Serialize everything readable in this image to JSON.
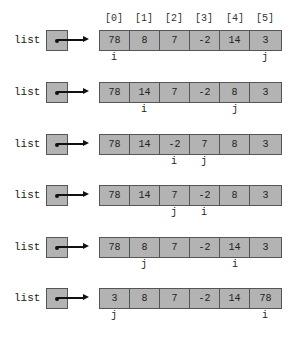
{
  "variable_name": "list",
  "indices": [
    "[0]",
    "[1]",
    "[2]",
    "[3]",
    "[4]",
    "[5]"
  ],
  "steps": [
    {
      "values": [
        "78",
        "8",
        "7",
        "-2",
        "14",
        "3"
      ],
      "i": 0,
      "j": 5
    },
    {
      "values": [
        "78",
        "14",
        "7",
        "-2",
        "8",
        "3"
      ],
      "i": 1,
      "j": 4
    },
    {
      "values": [
        "78",
        "14",
        "-2",
        "7",
        "8",
        "3"
      ],
      "i": 2,
      "j": 3
    },
    {
      "values": [
        "78",
        "14",
        "7",
        "-2",
        "8",
        "3"
      ],
      "i": 3,
      "j": 2
    },
    {
      "values": [
        "78",
        "8",
        "7",
        "-2",
        "14",
        "3"
      ],
      "i": 4,
      "j": 1
    },
    {
      "values": [
        "3",
        "8",
        "7",
        "-2",
        "14",
        "78"
      ],
      "i": 5,
      "j": 0
    }
  ],
  "pointer_labels": {
    "i": "i",
    "j": "j"
  },
  "colors": {
    "cell_fill": "#b3b3b3",
    "border": "#555555",
    "text": "#222222"
  }
}
